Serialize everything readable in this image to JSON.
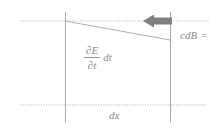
{
  "figure": {
    "background_color": "#ffffff",
    "line_color": "#a8a8a8",
    "dotted_color": "#bdbdbd",
    "arrow_color": "#808080",
    "text_color": "#8a8a8a",
    "width": 222,
    "height": 131
  },
  "labels": {
    "flux_term": {
      "numerator": "∂E",
      "denominator": "∂t",
      "multiplier": "dt",
      "full": "∂E/∂t dt"
    },
    "field_term": {
      "symbol": "cdB",
      "operator": "="
    },
    "width_term": {
      "symbol": "dx"
    }
  },
  "geometry": {
    "top_guide_line": {
      "y": 21,
      "x_start": 20,
      "x_end": 210,
      "style": "dotted"
    },
    "bottom_guide_line": {
      "y": 105,
      "x_start": 20,
      "x_end": 207,
      "style": "dotted"
    },
    "left_vertical_line": {
      "x": 65,
      "y_start": 12,
      "y_end": 122,
      "style": "solid"
    },
    "right_vertical_line": {
      "x": 170,
      "y_start": 12,
      "y_end": 122,
      "style": "solid"
    },
    "slanted_line": {
      "x1": 65,
      "y1": 21,
      "x2": 170,
      "y2": 40,
      "style": "solid"
    },
    "arrow": {
      "x_tail": 172,
      "x_head": 143,
      "y": 21,
      "direction": "left"
    }
  }
}
